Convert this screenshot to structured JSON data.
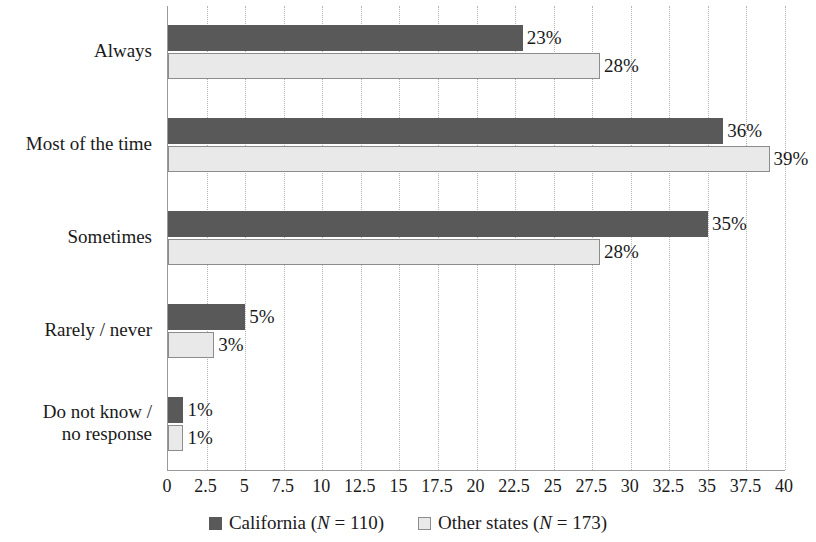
{
  "chart_data": {
    "type": "bar",
    "orientation": "horizontal",
    "title": "",
    "xlabel": "",
    "ylabel": "",
    "xlim": [
      0,
      40
    ],
    "xticks": [
      "0",
      "2.5",
      "5",
      "7.5",
      "10",
      "12.5",
      "15",
      "17.5",
      "20",
      "22.5",
      "25",
      "27.5",
      "30",
      "32.5",
      "35",
      "37.5",
      "40"
    ],
    "xtick_values": [
      0,
      2.5,
      5,
      7.5,
      10,
      12.5,
      15,
      17.5,
      20,
      22.5,
      25,
      27.5,
      30,
      32.5,
      35,
      37.5,
      40
    ],
    "grid": "vertical-dotted",
    "legend_position": "bottom-center",
    "categories": [
      "Always",
      "Most of the time",
      "Sometimes",
      "Rarely / never",
      "Do not know /\nno response"
    ],
    "series": [
      {
        "name": "California (N = 110)",
        "short_name": "California",
        "n": 110,
        "color": "#595959",
        "values": [
          23,
          36,
          35,
          5,
          1
        ],
        "labels": [
          "23%",
          "36%",
          "35%",
          "5%",
          "1%"
        ]
      },
      {
        "name": "Other states (N = 173)",
        "short_name": "Other states",
        "n": 173,
        "color": "#e9e9e9",
        "border_color": "#8c8c8c",
        "values": [
          28,
          39,
          28,
          3,
          1
        ],
        "labels": [
          "28%",
          "39%",
          "28%",
          "3%",
          "1%"
        ]
      }
    ]
  },
  "legend": {
    "items": [
      {
        "label_prefix": "California (",
        "n_symbol": "N",
        "n_value": " = 110)",
        "swatch": "dark-gray-square"
      },
      {
        "label_prefix": "Other states (",
        "n_symbol": "N",
        "n_value": " = 173)",
        "swatch": "light-gray-square"
      }
    ]
  }
}
